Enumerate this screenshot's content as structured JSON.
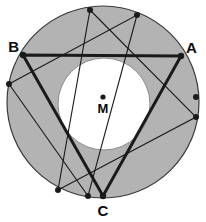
{
  "figure": {
    "labels": {
      "a": "A",
      "b": "B",
      "c": "C",
      "m": "M"
    },
    "colors": {
      "ring_fill": "#b3b3b3",
      "inner_fill": "#ffffff",
      "stroke": "#1a1a1a",
      "background": "#ffffff"
    },
    "geometry": {
      "outer_circle": {
        "cx": 103,
        "cy": 102,
        "r": 96
      },
      "inner_circle": {
        "cx": 104,
        "cy": 104,
        "r": 46
      },
      "center_point": {
        "x": 103,
        "y": 97
      },
      "bold_triangle": {
        "name": "ABC",
        "stroke_width": 3,
        "vertices": [
          {
            "label": "A",
            "x": 181,
            "y": 56
          },
          {
            "label": "B",
            "x": 23,
            "y": 55
          },
          {
            "label": "C",
            "x": 103,
            "y": 196
          }
        ]
      },
      "thin_triangle": {
        "name": "A'B'C'",
        "stroke_width": 1,
        "vertices": [
          {
            "label": "P1",
            "x": 90,
            "y": 10
          },
          {
            "label": "P2",
            "x": 196,
            "y": 117
          },
          {
            "label": "P3",
            "x": 58,
            "y": 190
          }
        ]
      },
      "thin_triangle_2": {
        "name": "A''B''C''",
        "stroke_width": 1,
        "vertices": [
          {
            "label": "Q1",
            "x": 137,
            "y": 15
          },
          {
            "label": "Q2",
            "x": 88,
            "y": 196
          },
          {
            "label": "Q3",
            "x": 9,
            "y": 84
          }
        ]
      },
      "marked_points": [
        {
          "x": 90,
          "y": 10
        },
        {
          "x": 137,
          "y": 15
        },
        {
          "x": 196,
          "y": 97
        },
        {
          "x": 196,
          "y": 117
        },
        {
          "x": 88,
          "y": 196
        },
        {
          "x": 58,
          "y": 190
        },
        {
          "x": 9,
          "y": 84
        }
      ],
      "label_positions": {
        "A": {
          "x": 186,
          "y": 53
        },
        "B": {
          "x": 19,
          "y": 52
        },
        "C": {
          "x": 103,
          "y": 216
        },
        "M": {
          "x": 103,
          "y": 113
        }
      }
    }
  }
}
